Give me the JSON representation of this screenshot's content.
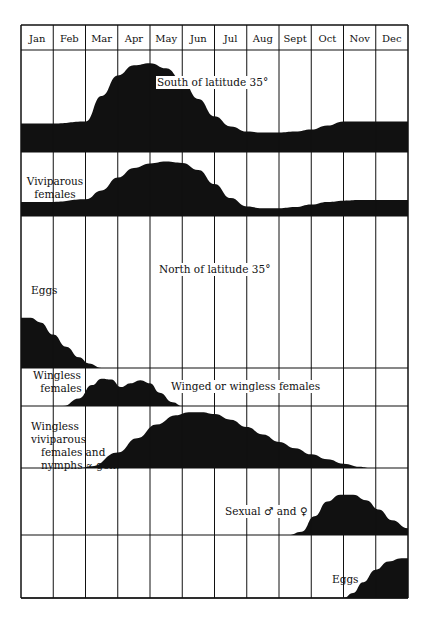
{
  "chart_data": {
    "type": "area",
    "title": "",
    "xlabel": "",
    "ylabel": "",
    "categories": [
      "Jan",
      "Feb",
      "Mar",
      "Apr",
      "May",
      "Jun",
      "Jul",
      "Aug",
      "Sept",
      "Oct",
      "Nov",
      "Dec"
    ],
    "grid": true,
    "sections": [
      {
        "name": "South of latitude 35°",
        "rows": [
          0,
          1
        ]
      },
      {
        "name": "North of latitude 35°",
        "rows": [
          2,
          3,
          4,
          5,
          6
        ]
      }
    ],
    "series": [
      {
        "name": "Nymphs",
        "region": "South of latitude 35°",
        "x": [
          0,
          1,
          2,
          2.5,
          3,
          3.5,
          4,
          4.5,
          5,
          5.5,
          6,
          6.5,
          7,
          7.5,
          8,
          8.5,
          9,
          9.5,
          10,
          10.5,
          11,
          12
        ],
        "values": [
          0.28,
          0.28,
          0.3,
          0.55,
          0.75,
          0.85,
          0.87,
          0.82,
          0.7,
          0.52,
          0.35,
          0.25,
          0.2,
          0.19,
          0.19,
          0.2,
          0.22,
          0.26,
          0.3,
          0.3,
          0.3,
          0.3
        ]
      },
      {
        "name": "Viviparous females",
        "region": "South of latitude 35°",
        "x": [
          0,
          1,
          2,
          2.5,
          3,
          3.5,
          4,
          4.5,
          5,
          5.5,
          6,
          6.5,
          7,
          7.5,
          8,
          8.5,
          9,
          9.5,
          10,
          10.5,
          11,
          12
        ],
        "values": [
          0.22,
          0.22,
          0.26,
          0.4,
          0.6,
          0.75,
          0.82,
          0.85,
          0.83,
          0.72,
          0.5,
          0.28,
          0.15,
          0.12,
          0.12,
          0.14,
          0.18,
          0.22,
          0.24,
          0.25,
          0.25,
          0.25
        ]
      },
      {
        "name": "Eggs",
        "region": "North of latitude 35°",
        "x": [
          0,
          0.3,
          0.6,
          1,
          1.4,
          1.8,
          2.1,
          2.5,
          12
        ],
        "values": [
          0.33,
          0.33,
          0.3,
          0.22,
          0.14,
          0.07,
          0.03,
          0,
          0
        ]
      },
      {
        "name": "Wingless females",
        "region": "North of latitude 35°",
        "note": "Winged or wingless females",
        "x": [
          0,
          1.3,
          1.8,
          2.2,
          2.5,
          2.8,
          3.1,
          3.4,
          3.7,
          4,
          4.3,
          4.7,
          5,
          12
        ],
        "values": [
          0,
          0,
          0.2,
          0.55,
          0.72,
          0.7,
          0.5,
          0.6,
          0.68,
          0.6,
          0.35,
          0.1,
          0,
          0
        ]
      },
      {
        "name": "Wingless viviparous females and nymphs ∝ gen.",
        "region": "North of latitude 35°",
        "x": [
          0,
          1.8,
          2.2,
          3,
          3.6,
          4.2,
          4.8,
          5.2,
          5.6,
          6,
          6.5,
          7,
          7.5,
          8,
          8.5,
          9,
          9.5,
          10,
          10.5,
          10.8,
          12
        ],
        "values": [
          0,
          0,
          0.03,
          0.25,
          0.48,
          0.7,
          0.85,
          0.9,
          0.9,
          0.87,
          0.78,
          0.66,
          0.54,
          0.42,
          0.32,
          0.22,
          0.14,
          0.07,
          0.02,
          0,
          0
        ]
      },
      {
        "name": "Sexual ♂ and ♀",
        "region": "North of latitude 35°",
        "x": [
          0,
          8.3,
          8.7,
          9.1,
          9.5,
          9.9,
          10.3,
          10.7,
          11.1,
          11.5,
          12
        ],
        "values": [
          0,
          0,
          0.05,
          0.28,
          0.5,
          0.6,
          0.6,
          0.52,
          0.38,
          0.22,
          0.1
        ]
      },
      {
        "name": "Eggs",
        "region": "North of latitude 35°",
        "x": [
          0,
          10,
          10.3,
          10.6,
          11,
          11.4,
          11.8,
          12
        ],
        "values": [
          0,
          0,
          0.08,
          0.25,
          0.45,
          0.58,
          0.63,
          0.63
        ]
      }
    ]
  },
  "header": {
    "months": [
      "Jan",
      "Feb",
      "Mar",
      "Apr",
      "May",
      "Jun",
      "Jul",
      "Aug",
      "Sept",
      "Oct",
      "Nov",
      "Dec"
    ]
  },
  "labels": {
    "south_region": "South of latitude 35°",
    "north_region": "North of latitude 35°",
    "nymphs": "Nymphs",
    "viviparous_line1": "Viviparous",
    "viviparous_line2": "females",
    "eggs_early": "Eggs",
    "wingless_line1": "Wingless",
    "wingless_line2": "females",
    "winged_or_wingless": "Winged or wingless females",
    "wv_line1": "Wingless viviparous",
    "wv_line2": "females and",
    "wv_line3": "nymphs ∝ gen.",
    "sexual": "Sexual ♂ and ♀",
    "eggs_late": "Eggs"
  },
  "colors": {
    "ink": "#111111",
    "paper": "#ffffff"
  }
}
